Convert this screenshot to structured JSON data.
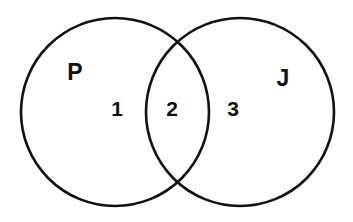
{
  "figure": {
    "type": "venn-diagram",
    "width": 353,
    "height": 222,
    "background_color": "#ffffff",
    "stroke_color": "#111111",
    "text_color": "#111111"
  },
  "sets": [
    {
      "id": "p",
      "label": "P",
      "label_x": 75,
      "label_y": 72,
      "circle": {
        "cx": 115,
        "cy": 112,
        "r": 94
      }
    },
    {
      "id": "j",
      "label": "J",
      "label_x": 283,
      "label_y": 78,
      "circle": {
        "cx": 240,
        "cy": 112,
        "r": 94
      }
    }
  ],
  "regions": [
    {
      "id": "p-only",
      "label": "1",
      "description": "P only",
      "x": 117,
      "y": 108
    },
    {
      "id": "intersection",
      "label": "2",
      "description": "P and J",
      "x": 172,
      "y": 108
    },
    {
      "id": "j-only",
      "label": "3",
      "description": "J only",
      "x": 233,
      "y": 108
    }
  ]
}
